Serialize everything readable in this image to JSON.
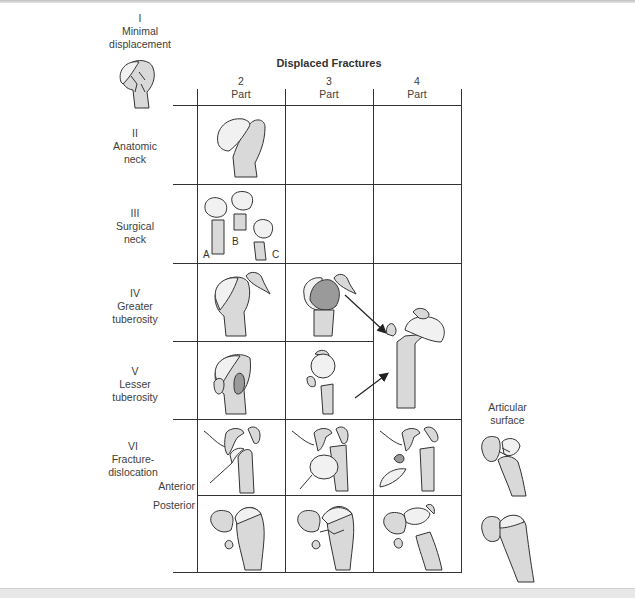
{
  "figure": {
    "title": "Displaced Fractures",
    "columns": [
      {
        "number": "2",
        "label": "Part"
      },
      {
        "number": "3",
        "label": "Part"
      },
      {
        "number": "4",
        "label": "Part"
      }
    ],
    "categories": [
      {
        "numeral": "I",
        "line1": "Minimal",
        "line2": "displacement"
      },
      {
        "numeral": "II",
        "line1": "Anatomic",
        "line2": "neck"
      },
      {
        "numeral": "III",
        "line1": "Surgical",
        "line2": "neck"
      },
      {
        "numeral": "IV",
        "line1": "Greater",
        "line2": "tuberosity"
      },
      {
        "numeral": "V",
        "line1": "Lesser",
        "line2": "tuberosity"
      },
      {
        "numeral": "VI",
        "line1": "Fracture-",
        "line2": "dislocation"
      }
    ],
    "subrows": {
      "anterior": "Anterior",
      "posterior": "Posterior"
    },
    "surgical_neck_variants": [
      "A",
      "B",
      "C"
    ],
    "side_label": {
      "line1": "Articular",
      "line2": "surface"
    }
  },
  "colors": {
    "grid": "#333333",
    "bone_fill": "#d9d9d9",
    "head_fill": "#f1f1f1",
    "fragment_dark": "#9a9a9a",
    "text": "#3d3d3d"
  }
}
